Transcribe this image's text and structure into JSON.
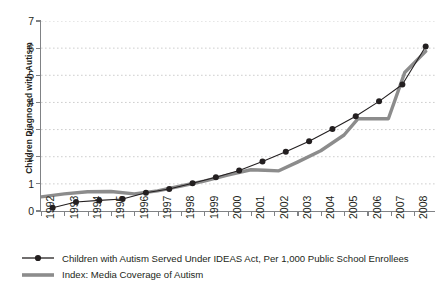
{
  "chart_data": {
    "type": "line",
    "title": "",
    "xlabel": "",
    "ylabel": "Children Diagnosed with Autism",
    "xlim": [
      1992,
      2008.9
    ],
    "ylim": [
      0,
      7
    ],
    "grid": true,
    "grid_axis": "y",
    "legend_position": "bottom-left",
    "x_tick_labels": [
      "1992",
      "1993",
      "1994",
      "1995",
      "1996",
      "1997",
      "1998",
      "1999",
      "2000",
      "2001",
      "2002",
      "2003",
      "2004",
      "2005",
      "2006",
      "2007",
      "2008"
    ],
    "y_tick_labels": [
      "0",
      "1",
      "2",
      "3",
      "4",
      "5",
      "6",
      "7"
    ],
    "x": [
      1992.5,
      1993.5,
      1994.5,
      1995.5,
      1996.5,
      1997.5,
      1998.5,
      1999.5,
      2000.5,
      2001.5,
      2002.5,
      2003.5,
      2004.5,
      2005.5,
      2006.5,
      2007.5,
      2008.5
    ],
    "series": [
      {
        "name": "Children with Autism Served Under IDEAS Act, Per 1,000 Public School Enrollees",
        "color": "#231f20",
        "marker": "circle",
        "linewidth": 1.1,
        "values": [
          0.12,
          0.33,
          0.39,
          0.44,
          0.67,
          0.81,
          1.02,
          1.24,
          1.49,
          1.82,
          2.18,
          2.57,
          3.02,
          3.49,
          4.04,
          4.66,
          6.06
        ]
      },
      {
        "name": "Index: Media Coverage of Autism",
        "color": "#8c8c8c",
        "marker": "none",
        "linewidth": 3.4,
        "x": [
          1992.0,
          1993.0,
          1994.0,
          1995.0,
          1996.0,
          1997.0,
          1998.0,
          1999.0,
          2000.0,
          2001.0,
          2001.6,
          2002.2,
          2003.0,
          2004.0,
          2005.0,
          2005.6,
          2006.4,
          2006.9,
          2007.6,
          2008.5
        ],
        "values": [
          0.52,
          0.63,
          0.71,
          0.72,
          0.63,
          0.74,
          0.92,
          1.1,
          1.32,
          1.52,
          1.5,
          1.48,
          1.8,
          2.22,
          2.8,
          3.4,
          3.4,
          3.4,
          5.1,
          5.88
        ]
      }
    ]
  },
  "legend": {
    "items": [
      {
        "label": "Children with Autism Served Under IDEAS Act, Per 1,000 Public School Enrollees",
        "style": "line-marker",
        "color": "#231f20"
      },
      {
        "label": "Index: Media Coverage of Autism",
        "style": "thick-line",
        "color": "#8c8c8c"
      }
    ]
  },
  "axes": {
    "y_title": "Children Diagnosed with Autism"
  },
  "colors": {
    "series_primary": "#231f20",
    "series_secondary": "#8c8c8c",
    "axis": "#808285",
    "grid": "#c8c8c8",
    "background": "#ffffff"
  }
}
